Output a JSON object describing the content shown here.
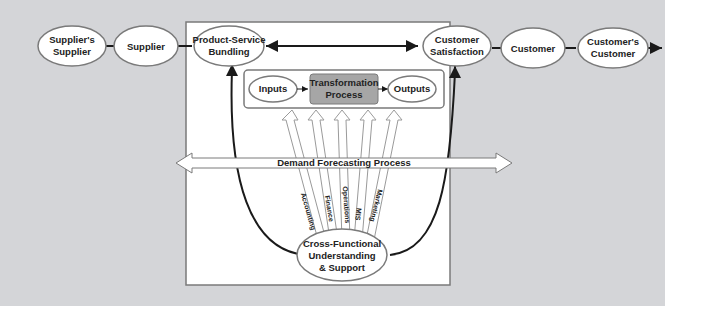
{
  "colors": {
    "background": "#d4d5d8",
    "panel": "#ffffff",
    "ellipse_fill": "#ffffff",
    "ellipse_stroke": "#7a7a7a",
    "process_fill": "#a6a6a6",
    "line": "#1a1a1a"
  },
  "chain": {
    "suppliers_supplier": [
      "Supplier's",
      "Supplier"
    ],
    "supplier": "Supplier",
    "customer": "Customer",
    "customers_customer": [
      "Customer's",
      "Customer"
    ]
  },
  "core": {
    "product_service_bundling": [
      "Product-Service",
      "Bundling"
    ],
    "customer_satisfaction": [
      "Customer",
      "Satisfaction"
    ]
  },
  "process": {
    "inputs": "Inputs",
    "transformation": [
      "Transformation",
      "Process"
    ],
    "outputs": "Outputs"
  },
  "demand_forecasting": "Demand Forecasting Process",
  "functions": [
    "Accounting",
    "Finance",
    "Operations",
    "MIS",
    "Marketing"
  ],
  "cross_functional": [
    "Cross-Functional",
    "Understanding",
    "& Support"
  ]
}
